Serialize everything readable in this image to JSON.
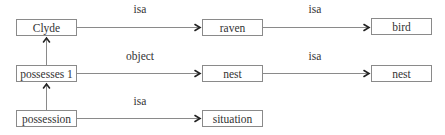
{
  "diagram": {
    "type": "semantic-network",
    "nodes": [
      {
        "id": "clyde",
        "label": "Clyde",
        "x": 16,
        "y": 19,
        "w": 61,
        "h": 17
      },
      {
        "id": "raven",
        "label": "raven",
        "x": 202,
        "y": 19,
        "w": 61,
        "h": 17
      },
      {
        "id": "bird",
        "label": "bird",
        "x": 371,
        "y": 18,
        "w": 61,
        "h": 17
      },
      {
        "id": "possesses1",
        "label": "possesses 1",
        "x": 16,
        "y": 65,
        "w": 61,
        "h": 17
      },
      {
        "id": "nest_mid",
        "label": "nest",
        "x": 202,
        "y": 65,
        "w": 61,
        "h": 17
      },
      {
        "id": "nest_right",
        "label": "nest",
        "x": 371,
        "y": 65,
        "w": 61,
        "h": 17
      },
      {
        "id": "possession",
        "label": "possession",
        "x": 16,
        "y": 110,
        "w": 61,
        "h": 17
      },
      {
        "id": "situation",
        "label": "situation",
        "x": 202,
        "y": 110,
        "w": 61,
        "h": 17
      }
    ],
    "edges": [
      {
        "from": "clyde",
        "to": "raven",
        "label": "isa",
        "label_x": 140,
        "label_y": 4
      },
      {
        "from": "raven",
        "to": "bird",
        "label": "isa",
        "label_x": 315,
        "label_y": 4
      },
      {
        "from": "possesses1",
        "to": "nest_mid",
        "label": "object",
        "label_x": 140,
        "label_y": 51
      },
      {
        "from": "nest_mid",
        "to": "nest_right",
        "label": "isa",
        "label_x": 315,
        "label_y": 51
      },
      {
        "from": "possession",
        "to": "situation",
        "label": "isa",
        "label_x": 140,
        "label_y": 96
      },
      {
        "from": "possesses1",
        "to": "clyde",
        "label": "",
        "vertical": true
      },
      {
        "from": "possession",
        "to": "possesses1",
        "label": "",
        "vertical": true
      }
    ]
  }
}
